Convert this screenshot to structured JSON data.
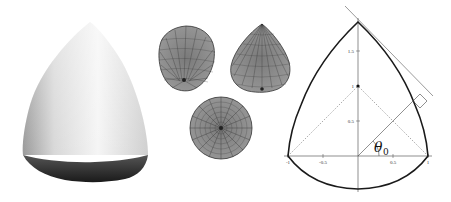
{
  "panels": {
    "solid_render": {
      "label": "shaded 3D solid of revolution (Reuleaux-type body)"
    },
    "mesh_views": {
      "views": [
        "side-view-1",
        "side-view-2",
        "bottom-view"
      ]
    },
    "cross_section": {
      "axis_ticks_x": [
        "-1",
        "-0.5",
        "0.5",
        "1"
      ],
      "axis_ticks_y": [
        "0.5",
        "1",
        "1.5"
      ],
      "angle_label": "θ",
      "angle_subscript": "0"
    }
  },
  "colors": {
    "background": "#ffffff",
    "curve": "#1a1a1a",
    "mesh_fill": "#8a8a8a",
    "mesh_line": "#333333",
    "solid_light": "#f2f2f2",
    "solid_dark": "#2a2a2a"
  }
}
